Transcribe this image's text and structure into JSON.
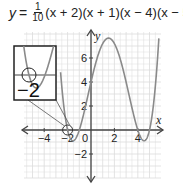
{
  "equation": {
    "lhs": "y",
    "equals": "=",
    "frac_num": "1",
    "frac_den": "10",
    "factors": "(x + 2)(x + 1)(x − 4)(x − 5)"
  },
  "chart_data": {
    "type": "line",
    "xlabel": "x",
    "ylabel": "y",
    "xlim": [
      -5.7,
      5.9
    ],
    "ylim": [
      -4,
      8.2
    ],
    "grid": true,
    "x_ticks": [
      -4,
      -2,
      0,
      2,
      4
    ],
    "x_tick_labels": [
      "−4",
      "−2",
      "0",
      "2",
      "4"
    ],
    "y_ticks": [
      6,
      4,
      2,
      -2
    ],
    "y_tick_labels": [
      "6",
      "4",
      "2",
      "−2"
    ],
    "function": {
      "coefficient": 0.1,
      "roots": [
        -2,
        -1,
        4,
        5
      ]
    },
    "series": [
      {
        "name": "y = 1/10 (x + 2)(x + 1)(x − 4)(x − 5)",
        "x": [
          -2.3,
          -2,
          -1.5,
          -1,
          0,
          1,
          1.5,
          2,
          3,
          4,
          4.5,
          5,
          5.4
        ],
        "y": [
          1.44,
          0,
          -0.74,
          0,
          4,
          7.2,
          7.66,
          7.2,
          2.4,
          0,
          -0.74,
          0,
          2.52
        ]
      }
    ],
    "annotations": [
      {
        "type": "circle",
        "at": [
          -2,
          0
        ],
        "note": "zoomed root"
      },
      {
        "type": "inset",
        "label": "−2",
        "description": "magnified view of root at x = −2"
      }
    ],
    "legend": "none"
  },
  "inset": {
    "label": "−2"
  },
  "colors": {
    "curve": "#8a8a8a",
    "axis": "#444444",
    "grid": "#dcdcdc",
    "text": "#222222",
    "inset_border": "#222222"
  }
}
